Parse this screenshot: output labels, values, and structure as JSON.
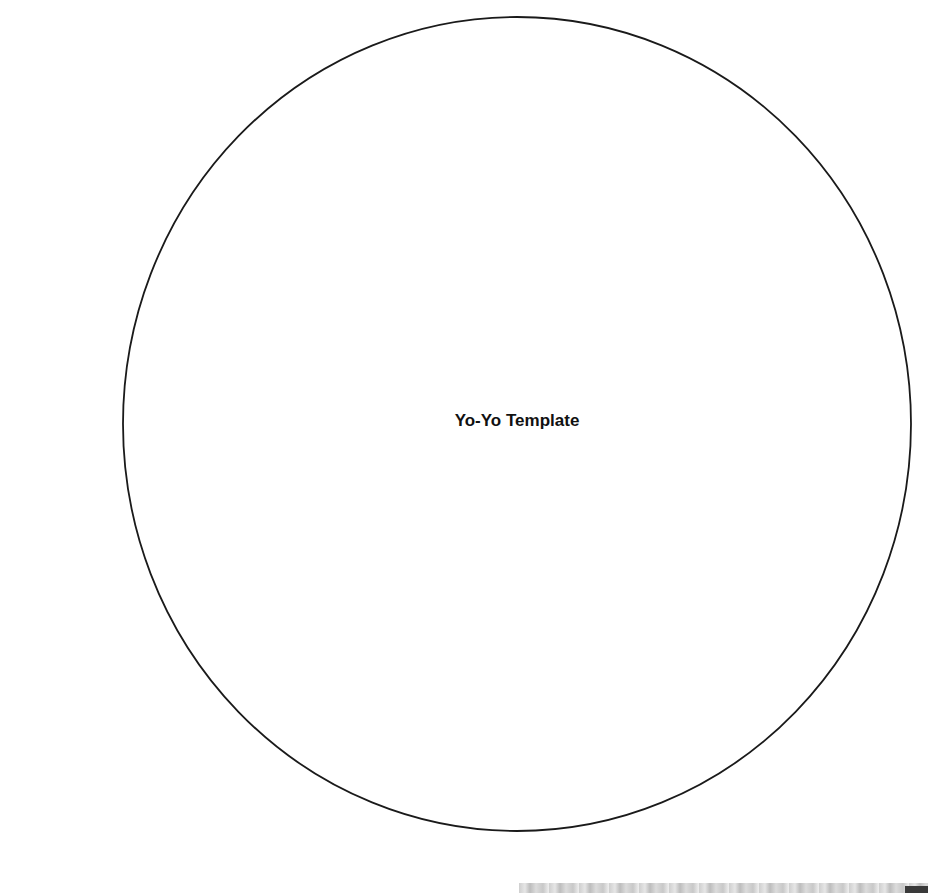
{
  "document": {
    "title": "Yo-Yo Template"
  },
  "shape": {
    "type": "circle-outline",
    "cx": 517,
    "cy": 424,
    "rx": 394,
    "ry": 407,
    "stroke": "#1a1a1a"
  },
  "colors": {
    "background": "#ffffff",
    "line": "#1a1a1a",
    "text": "#111111"
  }
}
